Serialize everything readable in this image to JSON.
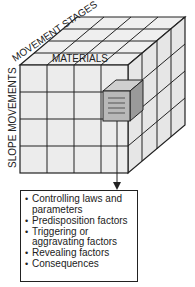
{
  "diagram": {
    "type": "3D matrix cube",
    "axes": {
      "top_depth": "MOVEMENT STAGES",
      "top_front": "MATERIALS",
      "left_vertical": "SLOPE MOVEMENTS"
    },
    "grid": {
      "rows": 4,
      "columns": 4,
      "depth": 4
    },
    "highlighted_cell": {
      "row": 2,
      "column": 4,
      "style": "gray extruded block"
    },
    "arrow": "from highlighted cell down to info box",
    "info_box": {
      "items": [
        "Controlling laws and parameters",
        "Predisposition factors",
        "Triggering or aggravating factors",
        "Revealing factors",
        "Consequences"
      ]
    },
    "colors": {
      "cube_face": "#ececec",
      "cube_line": "#222222",
      "block_front": "#b8b8b8",
      "block_side": "#9a9a9a"
    }
  }
}
